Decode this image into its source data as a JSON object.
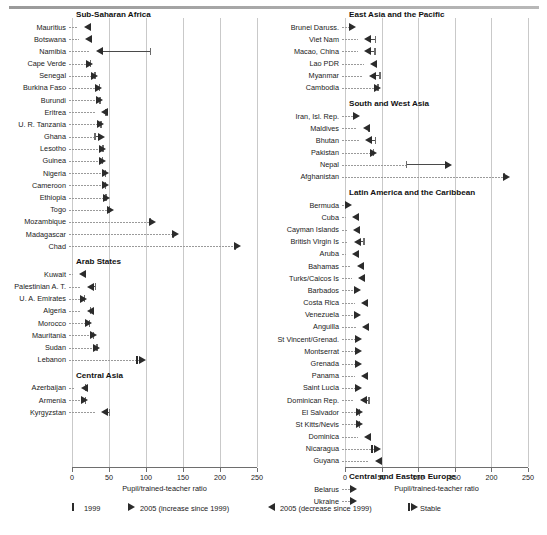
{
  "chart_data": {
    "type": "bar",
    "chart_kind": "arrow-range-dot-plot",
    "title": "",
    "xlabel": "Pupil/trained-teacher ratio",
    "ylabel": "",
    "xlim": [
      0,
      250
    ],
    "xticks": [
      0,
      50,
      100,
      150,
      200,
      250
    ],
    "grid": true,
    "legend_position": "bottom",
    "legend": [
      {
        "key": "1999",
        "label": "1999",
        "glyph": "tick"
      },
      {
        "key": "increase",
        "label": "2005 (increase since 1999)",
        "glyph": "arrow-right"
      },
      {
        "key": "decrease",
        "label": "2005 (decrease since 1999)",
        "glyph": "arrow-left"
      },
      {
        "key": "stable",
        "label": "Stable",
        "glyph": "stable"
      }
    ],
    "columns": [
      {
        "id": "left",
        "xlabel": "Pupil/trained-teacher ratio",
        "groups": [
          {
            "name": "Sub-Saharan Africa",
            "rows": [
              {
                "label": "Mauritius",
                "v1999": 19,
                "v2005": 17,
                "dir": "decrease"
              },
              {
                "label": "Botswana",
                "v1999": 21,
                "v2005": 19,
                "dir": "decrease"
              },
              {
                "label": "Namibia",
                "v1999": 105,
                "v2005": 34,
                "dir": "decrease"
              },
              {
                "label": "Cape Verde",
                "v1999": 24,
                "v2005": 27,
                "dir": "increase"
              },
              {
                "label": "Senegal",
                "v1999": 30,
                "v2005": 34,
                "dir": "increase"
              },
              {
                "label": "Burkina Faso",
                "v1999": 36,
                "v2005": 39,
                "dir": "increase"
              },
              {
                "label": "Burundi",
                "v1999": 37,
                "v2005": 41,
                "dir": "increase"
              },
              {
                "label": "Eritrea",
                "v1999": 45,
                "v2005": 40,
                "dir": "decrease"
              },
              {
                "label": "U. R. Tanzania",
                "v1999": 38,
                "v2005": 42,
                "dir": "increase"
              },
              {
                "label": "Ghana",
                "v1999": 30,
                "v2005": 43,
                "dir": "increase"
              },
              {
                "label": "Lesotho",
                "v1999": 41,
                "v2005": 45,
                "dir": "increase"
              },
              {
                "label": "Guinea",
                "v1999": 40,
                "v2005": 44,
                "dir": "increase"
              },
              {
                "label": "Nigeria",
                "v1999": 44,
                "v2005": 49,
                "dir": "increase"
              },
              {
                "label": "Cameroon",
                "v1999": 44,
                "v2005": 49,
                "dir": "increase"
              },
              {
                "label": "Ethiopia",
                "v1999": 45,
                "v2005": 50,
                "dir": "increase"
              },
              {
                "label": "Togo",
                "v1999": 50,
                "v2005": 56,
                "dir": "increase"
              },
              {
                "label": "Mozambique",
                "v1999": 105,
                "v2005": 112,
                "dir": "increase"
              },
              {
                "label": "Madagascar",
                "v1999": 136,
                "v2005": 143,
                "dir": "increase"
              },
              {
                "label": "Chad",
                "v1999": 220,
                "v2005": 227,
                "dir": "increase"
              }
            ]
          },
          {
            "name": "Arab States",
            "rows": [
              {
                "label": "Kuwait",
                "v1999": 13,
                "v2005": 11,
                "dir": "decrease"
              },
              {
                "label": "Palestinian A. T.",
                "v1999": 31,
                "v2005": 21,
                "dir": "decrease"
              },
              {
                "label": "U. A. Emirates",
                "v1999": 16,
                "v2005": 19,
                "dir": "increase"
              },
              {
                "label": "Algeria",
                "v1999": 24,
                "v2005": 21,
                "dir": "decrease"
              },
              {
                "label": "Morocco",
                "v1999": 23,
                "v2005": 26,
                "dir": "increase"
              },
              {
                "label": "Mauritania",
                "v1999": 28,
                "v2005": 33,
                "dir": "increase"
              },
              {
                "label": "Sudan",
                "v1999": 33,
                "v2005": 37,
                "dir": "increase"
              },
              {
                "label": "Lebanon",
                "v1999": 92,
                "v2005": 92,
                "dir": "stable"
              }
            ]
          },
          {
            "name": "Central Asia",
            "rows": [
              {
                "label": "Azerbaijan",
                "v1999": 17,
                "v2005": 14,
                "dir": "decrease"
              },
              {
                "label": "Armenia",
                "v1999": 17,
                "v2005": 20,
                "dir": "increase"
              },
              {
                "label": "Kyrgyzstan",
                "v1999": 50,
                "v2005": 41,
                "dir": "decrease"
              }
            ]
          }
        ]
      },
      {
        "id": "right",
        "xlabel": "Pupil/trained-teacher ratio",
        "groups": [
          {
            "name": "East Asia and the Pacific",
            "rows": [
              {
                "label": "Brunei Daruss.",
                "v1999": 11,
                "v2005": 14,
                "dir": "increase"
              },
              {
                "label": "Viet Nam",
                "v1999": 41,
                "v2005": 28,
                "dir": "decrease"
              },
              {
                "label": "Macao, China",
                "v1999": 40,
                "v2005": 28,
                "dir": "decrease"
              },
              {
                "label": "Lao PDR",
                "v1999": 37,
                "v2005": 35,
                "dir": "decrease"
              },
              {
                "label": "Myanmar",
                "v1999": 47,
                "v2005": 34,
                "dir": "decrease"
              },
              {
                "label": "Cambodia",
                "v1999": 44,
                "v2005": 48,
                "dir": "increase"
              }
            ]
          },
          {
            "name": "South and West Asia",
            "rows": [
              {
                "label": "Iran, Isl. Rep.",
                "v1999": 16,
                "v2005": 19,
                "dir": "increase"
              },
              {
                "label": "Maldives",
                "v1999": 32,
                "v2005": 26,
                "dir": "decrease"
              },
              {
                "label": "Bhutan",
                "v1999": 41,
                "v2005": 29,
                "dir": "decrease"
              },
              {
                "label": "Pakistan",
                "v1999": 38,
                "v2005": 43,
                "dir": "increase"
              },
              {
                "label": "Nepal",
                "v1999": 83,
                "v2005": 145,
                "dir": "increase"
              },
              {
                "label": "Afghanistan",
                "v1999": 217,
                "v2005": 224,
                "dir": "increase"
              }
            ]
          },
          {
            "name": "Latin America and the Caribbean",
            "rows": [
              {
                "label": "Bermuda",
                "v1999": 5,
                "v2005": 8,
                "dir": "increase"
              },
              {
                "label": "Cuba",
                "v1999": 13,
                "v2005": 11,
                "dir": "decrease"
              },
              {
                "label": "Cayman Islands",
                "v1999": 14,
                "v2005": 12,
                "dir": "decrease"
              },
              {
                "label": "British Virgin Is",
                "v1999": 25,
                "v2005": 14,
                "dir": "decrease"
              },
              {
                "label": "Aruba",
                "v1999": 13,
                "v2005": 11,
                "dir": "decrease"
              },
              {
                "label": "Bahamas",
                "v1999": 21,
                "v2005": 18,
                "dir": "decrease"
              },
              {
                "label": "Turks/Caicos Is",
                "v1999": 22,
                "v2005": 19,
                "dir": "decrease"
              },
              {
                "label": "Barbados",
                "v1999": 17,
                "v2005": 20,
                "dir": "increase"
              },
              {
                "label": "Costa Rica",
                "v1999": 26,
                "v2005": 23,
                "dir": "decrease"
              },
              {
                "label": "Venezuela",
                "v1999": 18,
                "v2005": 21,
                "dir": "increase"
              },
              {
                "label": "Anguilla",
                "v1999": 27,
                "v2005": 24,
                "dir": "decrease"
              },
              {
                "label": "St Vincent/Grenad.",
                "v1999": 19,
                "v2005": 22,
                "dir": "increase"
              },
              {
                "label": "Montserrat",
                "v1999": 19,
                "v2005": 22,
                "dir": "increase"
              },
              {
                "label": "Grenada",
                "v1999": 19,
                "v2005": 22,
                "dir": "increase"
              },
              {
                "label": "Panama",
                "v1999": 26,
                "v2005": 23,
                "dir": "decrease"
              },
              {
                "label": "Saint Lucia",
                "v1999": 19,
                "v2005": 22,
                "dir": "increase"
              },
              {
                "label": "Dominican Rep.",
                "v1999": 32,
                "v2005": 22,
                "dir": "decrease"
              },
              {
                "label": "El Salvador",
                "v1999": 19,
                "v2005": 23,
                "dir": "increase"
              },
              {
                "label": "St Kitts/Nevis",
                "v1999": 19,
                "v2005": 23,
                "dir": "increase"
              },
              {
                "label": "Dominica",
                "v1999": 29,
                "v2005": 27,
                "dir": "decrease"
              },
              {
                "label": "Nicaragua",
                "v1999": 41,
                "v2005": 41,
                "dir": "stable"
              },
              {
                "label": "Guyana",
                "v1999": 46,
                "v2005": 43,
                "dir": "decrease"
              }
            ]
          },
          {
            "name": "Central and Eastern Europe",
            "rows": [
              {
                "label": "Belarus",
                "v1999": 12,
                "v2005": 15,
                "dir": "increase"
              },
              {
                "label": "Ukraine",
                "v1999": 12,
                "v2005": 15,
                "dir": "increase"
              }
            ]
          }
        ]
      }
    ]
  }
}
